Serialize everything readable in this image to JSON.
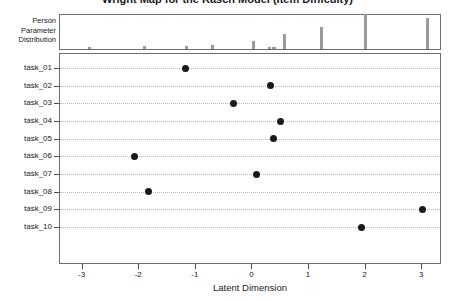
{
  "chart_data": {
    "type": "scatter",
    "title": "Wright Map for the Rasch Model (Item Difficulty)",
    "xlabel": "Latent Dimension",
    "ylabel": "",
    "xlim": [
      -3.4,
      3.35
    ],
    "xticks": [
      -3,
      -2,
      -1,
      0,
      1,
      2,
      3
    ],
    "xticklabels": [
      "-3",
      "-2",
      "-1",
      "0",
      "1",
      "2",
      "3"
    ],
    "grid": true,
    "grid_style": "dotted-horizontal",
    "legend": "none",
    "categories": [
      "task_01",
      "task_02",
      "task_03",
      "task_04",
      "task_05",
      "task_06",
      "task_07",
      "task_08",
      "task_09",
      "task_10"
    ],
    "values": [
      -1.18,
      0.32,
      -0.33,
      0.5,
      0.38,
      -2.08,
      0.07,
      -1.83,
      3.0,
      1.92
    ],
    "point_color": "#1a1a1a",
    "point_marker": "filled-circle",
    "panels": [
      {
        "name": "person-parameter-distribution",
        "label_lines": [
          "Person",
          "Parameter",
          "Distribution"
        ],
        "type": "bar",
        "bar_color": "#9a9a9a",
        "xlim": [
          -3.4,
          3.35
        ],
        "bars": [
          {
            "x": -2.88,
            "height": 0.07
          },
          {
            "x": -1.9,
            "height": 0.08
          },
          {
            "x": -1.17,
            "height": 0.09
          },
          {
            "x": -0.7,
            "height": 0.11
          },
          {
            "x": 0.02,
            "height": 0.22
          },
          {
            "x": 0.3,
            "height": 0.05
          },
          {
            "x": 0.38,
            "height": 0.05
          },
          {
            "x": 0.57,
            "height": 0.42
          },
          {
            "x": 1.22,
            "height": 0.63
          },
          {
            "x": 2.0,
            "height": 1.0
          },
          {
            "x": 3.1,
            "height": 0.9
          }
        ]
      }
    ]
  },
  "axes": {
    "x_title": "Latent Dimension",
    "x_tick_labels": [
      "-3",
      "-2",
      "-1",
      "0",
      "1",
      "2",
      "3"
    ],
    "y_tick_labels": [
      "task_01",
      "task_02",
      "task_03",
      "task_04",
      "task_05",
      "task_06",
      "task_07",
      "task_08",
      "task_09",
      "task_10"
    ]
  },
  "person_panel": {
    "label_line_1": "Person",
    "label_line_2": "Parameter",
    "label_line_3": "Distribution"
  },
  "colors": {
    "point": "#1a1a1a",
    "bar": "#9a9a9a",
    "grid": "#b9b9b9",
    "frame": "#6e6e6e",
    "text": "#1a1a1a",
    "background": "#ffffff"
  }
}
